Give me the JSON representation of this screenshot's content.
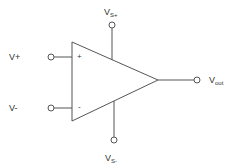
{
  "diagram": {
    "type": "op-amp symbol",
    "colors": {
      "stroke": "#555555",
      "text": "#333333",
      "background": "#ffffff"
    },
    "labels": {
      "non_inverting_input": "V+",
      "inverting_input": "V-",
      "plus_sign": "+",
      "minus_sign": "-",
      "positive_supply": {
        "main": "V",
        "sub": "S+"
      },
      "negative_supply": {
        "main": "V",
        "sub": "S-"
      },
      "output": {
        "main": "V",
        "sub": "out"
      }
    }
  }
}
